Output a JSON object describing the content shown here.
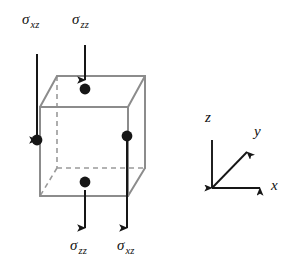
{
  "figure": {
    "background_color": "#ffffff",
    "cube": {
      "edge_color": "#8c8c8c",
      "hidden_edge_color": "#9a9a9a",
      "hidden_edge_style": "dashed"
    },
    "arrow_color": "#161616",
    "dot_color": "#161616",
    "stress_labels": [
      {
        "id": "sigma-xz-top-left",
        "symbol": "σ",
        "subscript": "xz",
        "x": 22,
        "y": 12,
        "arrow_direction": "up",
        "position": "top-left"
      },
      {
        "id": "sigma-zz-top-middle",
        "symbol": "σ",
        "subscript": "zz",
        "x": 72,
        "y": 12,
        "arrow_direction": "down",
        "position": "top-middle"
      },
      {
        "id": "sigma-zz-bottom-left",
        "symbol": "σ",
        "subscript": "zz",
        "x": 70,
        "y": 238,
        "arrow_direction": "up",
        "position": "bottom-left"
      },
      {
        "id": "sigma-xz-bottom-right",
        "symbol": "σ",
        "subscript": "xz",
        "x": 117,
        "y": 238,
        "arrow_direction": "down",
        "position": "bottom-right"
      }
    ],
    "axes": {
      "origin_label": "",
      "items": [
        {
          "id": "axis-z",
          "label": "z",
          "x": 205,
          "y": 110,
          "direction": "up"
        },
        {
          "id": "axis-y",
          "label": "y",
          "x": 254,
          "y": 124,
          "direction": "diagonal-up-right"
        },
        {
          "id": "axis-x",
          "label": "x",
          "x": 271,
          "y": 178,
          "direction": "right"
        }
      ]
    }
  }
}
